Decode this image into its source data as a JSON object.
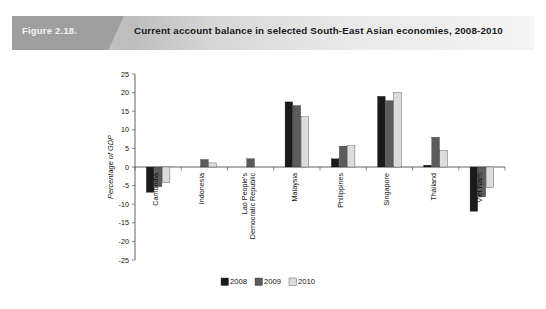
{
  "banner": {
    "figure_number": "Figure 2.18.",
    "title": "Current account balance in selected South-East Asian economies, 2008-2010"
  },
  "chart_data": {
    "type": "bar",
    "title": "Current account balance in selected South-East Asian economies, 2008-2010",
    "xlabel": "",
    "ylabel": "Percentage of GDP",
    "ylim": [
      -25,
      25
    ],
    "ytick_step": 5,
    "yticks": [
      25,
      20,
      15,
      10,
      5,
      0,
      -5,
      -10,
      -15,
      -20,
      -25
    ],
    "ytick_labels": [
      "25",
      "20",
      "15",
      "10",
      "5",
      "0",
      "-5",
      "-10",
      "-15",
      "-20",
      "-25"
    ],
    "grid": false,
    "legend_position": "bottom-center",
    "categories": [
      "Cambodia",
      "Indonesia",
      "Lao People's Democratic Republic",
      "Malaysia",
      "Philippines",
      "Singapore",
      "Thailand",
      "Viet Nam"
    ],
    "category_lines": [
      [
        "Cambodia"
      ],
      [
        "Indonesia"
      ],
      [
        "Lao People's",
        "Democratic Republic"
      ],
      [
        "Malaysia"
      ],
      [
        "Philippines"
      ],
      [
        "Singapore"
      ],
      [
        "Thailand"
      ],
      [
        "Viet Nam"
      ]
    ],
    "series": [
      {
        "name": "2008",
        "color": "#1a1a1a",
        "values": [
          -6.8,
          0.0,
          0.0,
          17.5,
          2.2,
          19.0,
          0.5,
          -11.9
        ]
      },
      {
        "name": "2009",
        "color": "#5c5c5c",
        "values": [
          -5.3,
          2.0,
          2.2,
          16.5,
          5.6,
          17.8,
          8.0,
          -8.0
        ]
      },
      {
        "name": "2010",
        "color": "#dcdcdc",
        "values": [
          -4.2,
          1.1,
          0.0,
          13.5,
          5.7,
          20.0,
          4.5,
          -5.5
        ]
      }
    ]
  },
  "legend": {
    "items": [
      {
        "label": "2008",
        "color": "#1a1a1a"
      },
      {
        "label": "2009",
        "color": "#5c5c5c"
      },
      {
        "label": "2010",
        "color": "#dcdcdc"
      }
    ]
  }
}
